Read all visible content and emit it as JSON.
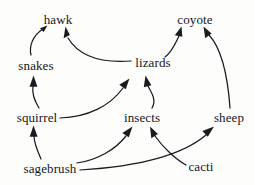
{
  "diagram": {
    "type": "food-web-diagram",
    "width": 254,
    "height": 185,
    "background_color": "#fdfdfc",
    "ink_color": "#1a1a1f",
    "nodes": [
      {
        "id": "hawk",
        "label": "hawk",
        "x": 58,
        "y": 19
      },
      {
        "id": "coyote",
        "label": "coyote",
        "x": 195,
        "y": 19
      },
      {
        "id": "snakes",
        "label": "snakes",
        "x": 36,
        "y": 65
      },
      {
        "id": "lizards",
        "label": "lizards",
        "x": 153,
        "y": 62
      },
      {
        "id": "squirrel",
        "label": "squirrel",
        "x": 37,
        "y": 117
      },
      {
        "id": "insects",
        "label": "insects",
        "x": 142,
        "y": 117
      },
      {
        "id": "sheep",
        "label": "sheep",
        "x": 229,
        "y": 117
      },
      {
        "id": "sagebrush",
        "label": "sagebrush",
        "x": 50,
        "y": 168
      },
      {
        "id": "cacti",
        "label": "cacti",
        "x": 201,
        "y": 166
      }
    ],
    "edges": [
      {
        "from": "snakes",
        "to": "hawk",
        "label": "snakes eaten by hawk"
      },
      {
        "from": "lizards",
        "to": "hawk",
        "label": "lizards eaten by hawk"
      },
      {
        "from": "lizards",
        "to": "coyote",
        "label": "lizards eaten by coyote"
      },
      {
        "from": "sheep",
        "to": "coyote",
        "label": "sheep eaten by coyote"
      },
      {
        "from": "squirrel",
        "to": "snakes",
        "label": "squirrel eaten by snakes"
      },
      {
        "from": "squirrel",
        "to": "lizards",
        "label": "squirrel eaten by lizards"
      },
      {
        "from": "insects",
        "to": "lizards",
        "label": "insects eaten by lizards"
      },
      {
        "from": "sagebrush",
        "to": "squirrel",
        "label": "sagebrush eaten by squirrel"
      },
      {
        "from": "sagebrush",
        "to": "insects",
        "label": "sagebrush eaten by insects"
      },
      {
        "from": "sagebrush",
        "to": "sheep",
        "label": "sagebrush eaten by sheep"
      },
      {
        "from": "cacti",
        "to": "insects",
        "label": "cacti eaten by insects"
      }
    ]
  }
}
